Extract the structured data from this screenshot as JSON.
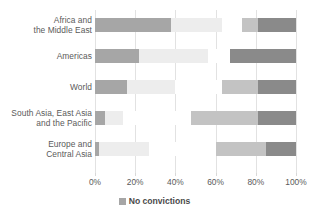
{
  "chart_data": {
    "type": "bar",
    "orientation": "horizontal",
    "stacked": true,
    "stack_mode": "percent",
    "title": "",
    "xlabel": "",
    "ylabel": "",
    "xlim": [
      0,
      100
    ],
    "grid": true,
    "legend_position": "bottom",
    "categories": [
      "Africa and\nthe Middle East",
      "Americas",
      "World",
      "South Asia, East Asia\nand the Pacific",
      "Europe and\nCentral Asia"
    ],
    "category_lines": [
      [
        "Africa and",
        "the Middle East"
      ],
      [
        "Americas"
      ],
      [
        "World"
      ],
      [
        "South Asia, East Asia",
        "and the Pacific"
      ],
      [
        "Europe and",
        "Central Asia"
      ]
    ],
    "xticks": [
      0,
      20,
      40,
      60,
      80,
      100
    ],
    "xtick_labels": [
      "0%",
      "20%",
      "40%",
      "60%",
      "80%",
      "100%"
    ],
    "series": [
      {
        "name": "No convictions",
        "color": "#a6a6a6",
        "values": [
          38,
          22,
          16,
          5,
          2
        ]
      },
      {
        "name": "series-2",
        "color": "#ededed",
        "values": [
          25,
          34,
          24,
          9,
          25
        ]
      },
      {
        "name": "series-3",
        "color": "#ffffff",
        "values": [
          10,
          11,
          23,
          34,
          33
        ]
      },
      {
        "name": "series-4",
        "color": "#c3c3c3",
        "values": [
          8,
          0,
          18,
          33,
          25
        ]
      },
      {
        "name": "series-5",
        "color": "#8a8a8a",
        "values": [
          19,
          33,
          19,
          19,
          15
        ]
      }
    ]
  },
  "legend": {
    "entries": [
      {
        "label": "No convictions",
        "color": "#a6a6a6"
      }
    ]
  },
  "axis": {
    "x_tick_labels": [
      "0%",
      "20%",
      "40%",
      "60%",
      "80%",
      "100%"
    ]
  }
}
